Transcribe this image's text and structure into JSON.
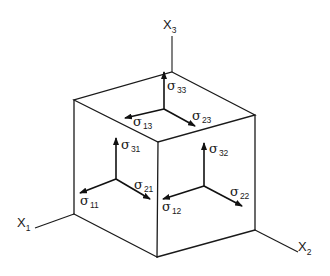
{
  "figure": {
    "axes": [
      {
        "id": "x1",
        "symbol": "X",
        "subscript": "1"
      },
      {
        "id": "x2",
        "symbol": "X",
        "subscript": "2"
      },
      {
        "id": "x3",
        "symbol": "X",
        "subscript": "3"
      }
    ],
    "stresses": {
      "top": [
        {
          "symbol": "σ",
          "subscript": "33"
        },
        {
          "symbol": "σ",
          "subscript": "13"
        },
        {
          "symbol": "σ",
          "subscript": "23"
        }
      ],
      "left": [
        {
          "symbol": "σ",
          "subscript": "31"
        },
        {
          "symbol": "σ",
          "subscript": "11"
        },
        {
          "symbol": "σ",
          "subscript": "21"
        }
      ],
      "right": [
        {
          "symbol": "σ",
          "subscript": "32"
        },
        {
          "symbol": "σ",
          "subscript": "12"
        },
        {
          "symbol": "σ",
          "subscript": "22"
        }
      ]
    },
    "colors": {
      "line": "#1a1a1a",
      "background": "#ffffff"
    }
  }
}
